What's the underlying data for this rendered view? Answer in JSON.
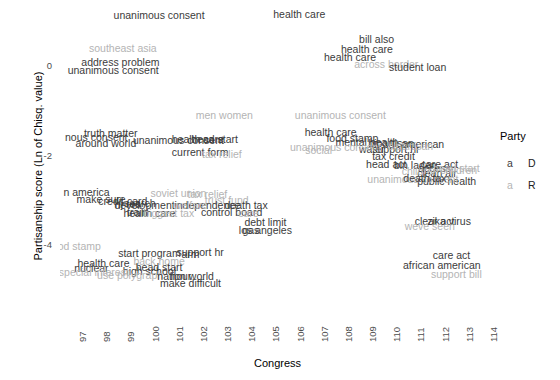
{
  "chart_data": {
    "type": "scatter",
    "title": "",
    "xlabel": "Congress",
    "ylabel": "Partisanship score (Ln of Chisq. value)",
    "xlim": [
      96.5,
      114.5
    ],
    "ylim": [
      -5.6,
      1.4
    ],
    "xticks": [
      97,
      98,
      99,
      100,
      101,
      102,
      103,
      104,
      105,
      106,
      107,
      108,
      109,
      110,
      111,
      112,
      113,
      114
    ],
    "yticks": [
      0,
      -2,
      -4
    ],
    "grid": false,
    "legend": {
      "title": "Party",
      "position": "right",
      "entries": [
        {
          "key": "a",
          "label": "D",
          "color": "#3b3b3b"
        },
        {
          "key": "a",
          "label": "R",
          "color": "#b4b4b4"
        }
      ]
    },
    "point_label_colors": {
      "D": "#3b3b3b",
      "R": "#b4b4b4"
    },
    "points": [
      {
        "text": "unanimous consent",
        "x": 100.6,
        "y": 1.15,
        "party": "D"
      },
      {
        "text": "health care",
        "x": 106.4,
        "y": 1.18,
        "party": "D"
      },
      {
        "text": "southeast asia",
        "x": 99.1,
        "y": 0.42,
        "party": "R"
      },
      {
        "text": "address problem",
        "x": 99.0,
        "y": 0.1,
        "party": "D"
      },
      {
        "text": "unanimous consent",
        "x": 98.7,
        "y": -0.08,
        "party": "D"
      },
      {
        "text": "bill also",
        "x": 109.6,
        "y": 0.62,
        "party": "D"
      },
      {
        "text": "health care",
        "x": 109.2,
        "y": 0.4,
        "party": "D"
      },
      {
        "text": "health care",
        "x": 108.5,
        "y": 0.22,
        "party": "D"
      },
      {
        "text": "across border",
        "x": 110.0,
        "y": 0.06,
        "party": "R"
      },
      {
        "text": "student loan",
        "x": 111.3,
        "y": -0.02,
        "party": "D"
      },
      {
        "text": "men women",
        "x": 103.3,
        "y": -1.1,
        "party": "R"
      },
      {
        "text": "unanimous consent",
        "x": 108.1,
        "y": -1.08,
        "party": "R"
      },
      {
        "text": "truth matter",
        "x": 98.6,
        "y": -1.5,
        "party": "D"
      },
      {
        "text": "nous consent",
        "x": 98.0,
        "y": -1.58,
        "party": "D"
      },
      {
        "text": "around world",
        "x": 98.4,
        "y": -1.72,
        "party": "D"
      },
      {
        "text": "unanimous consent",
        "x": 101.4,
        "y": -1.66,
        "party": "D"
      },
      {
        "text": "health care",
        "x": 102.2,
        "y": -1.64,
        "party": "D"
      },
      {
        "text": "head start",
        "x": 102.9,
        "y": -1.62,
        "party": "D"
      },
      {
        "text": "health care",
        "x": 107.7,
        "y": -1.48,
        "party": "D"
      },
      {
        "text": "food stamp",
        "x": 108.6,
        "y": -1.6,
        "party": "D"
      },
      {
        "text": "mental health",
        "x": 109.2,
        "y": -1.7,
        "party": "D"
      },
      {
        "text": "bipartisan",
        "x": 110.2,
        "y": -1.72,
        "party": "D"
      },
      {
        "text": "american",
        "x": 111.5,
        "y": -1.74,
        "party": "D"
      },
      {
        "text": "water",
        "x": 109.4,
        "y": -1.86,
        "party": "D"
      },
      {
        "text": "support hr",
        "x": 110.4,
        "y": -1.86,
        "party": "D"
      },
      {
        "text": "bipartisan",
        "x": 111.0,
        "y": -1.78,
        "party": "R"
      },
      {
        "text": "unanimous consent",
        "x": 107.9,
        "y": -1.8,
        "party": "R"
      },
      {
        "text": "social",
        "x": 107.2,
        "y": -1.88,
        "party": "R"
      },
      {
        "text": "current form",
        "x": 102.3,
        "y": -1.92,
        "party": "D"
      },
      {
        "text": "tax relief",
        "x": 103.2,
        "y": -1.96,
        "party": "R"
      },
      {
        "text": "tax credit",
        "x": 110.3,
        "y": -2.02,
        "party": "D"
      },
      {
        "text": "head act",
        "x": 110.0,
        "y": -2.18,
        "party": "D"
      },
      {
        "text": "bin laden",
        "x": 111.2,
        "y": -2.22,
        "party": "D"
      },
      {
        "text": "care act",
        "x": 112.2,
        "y": -2.18,
        "party": "D"
      },
      {
        "text": "access",
        "x": 112.0,
        "y": -2.28,
        "party": "D"
      },
      {
        "text": "clean air",
        "x": 112.1,
        "y": -2.4,
        "party": "D"
      },
      {
        "text": "children",
        "x": 111.4,
        "y": -2.34,
        "party": "R"
      },
      {
        "text": "head start",
        "x": 112.9,
        "y": -2.28,
        "party": "R"
      },
      {
        "text": "children",
        "x": 113.0,
        "y": -2.32,
        "party": "R"
      },
      {
        "text": "n america",
        "x": 97.6,
        "y": -2.82,
        "party": "D"
      },
      {
        "text": "make sure",
        "x": 98.2,
        "y": -2.98,
        "party": "D"
      },
      {
        "text": "credit card",
        "x": 99.1,
        "y": -3.02,
        "party": "D"
      },
      {
        "text": "soviet union",
        "x": 101.4,
        "y": -2.84,
        "party": "R"
      },
      {
        "text": "tax relief",
        "x": 102.6,
        "y": -2.86,
        "party": "R"
      },
      {
        "text": "trust fund",
        "x": 103.4,
        "y": -3.0,
        "party": "R"
      },
      {
        "text": "development",
        "x": 100.0,
        "y": -3.1,
        "party": "D"
      },
      {
        "text": "hj res",
        "x": 99.3,
        "y": -3.08,
        "party": "D"
      },
      {
        "text": "search",
        "x": 99.8,
        "y": -3.06,
        "party": "D"
      },
      {
        "text": "independence",
        "x": 102.6,
        "y": -3.12,
        "party": "D"
      },
      {
        "text": "welfare",
        "x": 101.9,
        "y": -3.1,
        "party": "R"
      },
      {
        "text": "death tax",
        "x": 104.2,
        "y": -3.1,
        "party": "D"
      },
      {
        "text": "control board",
        "x": 103.6,
        "y": -3.26,
        "party": "D"
      },
      {
        "text": "health care",
        "x": 100.2,
        "y": -3.28,
        "party": "D"
      },
      {
        "text": "train",
        "x": 99.7,
        "y": -3.26,
        "party": "D"
      },
      {
        "text": "biggest tax",
        "x": 101.0,
        "y": -3.3,
        "party": "R"
      },
      {
        "text": "care",
        "x": 104.3,
        "y": -3.28,
        "party": "R"
      },
      {
        "text": "debt limit",
        "x": 105.0,
        "y": -3.48,
        "party": "D"
      },
      {
        "text": "los angeles",
        "x": 105.0,
        "y": -3.66,
        "party": "D"
      },
      {
        "text": "gas",
        "x": 104.4,
        "y": -3.66,
        "party": "D"
      },
      {
        "text": "public health",
        "x": 112.5,
        "y": -2.58,
        "party": "D"
      },
      {
        "text": "unanimous consent",
        "x": 111.1,
        "y": -2.52,
        "party": "R"
      },
      {
        "text": "death tax",
        "x": 111.6,
        "y": -2.5,
        "party": "D"
      },
      {
        "text": "clear act",
        "x": 112.0,
        "y": -3.46,
        "party": "D"
      },
      {
        "text": "zika virus",
        "x": 112.6,
        "y": -3.46,
        "party": "D"
      },
      {
        "text": "weve seen",
        "x": 111.8,
        "y": -3.58,
        "party": "R"
      },
      {
        "text": "od stamp",
        "x": 97.3,
        "y": -4.02,
        "party": "R"
      },
      {
        "text": "start program",
        "x": 100.2,
        "y": -4.18,
        "party": "D"
      },
      {
        "text": "support hr",
        "x": 102.3,
        "y": -4.16,
        "party": "D"
      },
      {
        "text": "arm",
        "x": 101.9,
        "y": -4.2,
        "party": "D"
      },
      {
        "text": "back home",
        "x": 100.6,
        "y": -4.36,
        "party": "R"
      },
      {
        "text": "health care",
        "x": 98.3,
        "y": -4.42,
        "party": "D"
      },
      {
        "text": "head start",
        "x": 100.6,
        "y": -4.5,
        "party": "D"
      },
      {
        "text": "high school",
        "x": 100.2,
        "y": -4.58,
        "party": "D"
      },
      {
        "text": "nuclear",
        "x": 97.8,
        "y": -4.52,
        "party": "D"
      },
      {
        "text": "special interest",
        "x": 97.9,
        "y": -4.62,
        "party": "R"
      },
      {
        "text": "use polygraph",
        "x": 99.4,
        "y": -4.68,
        "party": "R"
      },
      {
        "text": "nation world",
        "x": 101.7,
        "y": -4.7,
        "party": "D"
      },
      {
        "text": "hour",
        "x": 101.5,
        "y": -4.7,
        "party": "D"
      },
      {
        "text": "make difficult",
        "x": 101.9,
        "y": -4.86,
        "party": "D"
      },
      {
        "text": "care act",
        "x": 112.7,
        "y": -4.24,
        "party": "D"
      },
      {
        "text": "african american",
        "x": 112.3,
        "y": -4.46,
        "party": "D"
      },
      {
        "text": "support bill",
        "x": 112.9,
        "y": -4.66,
        "party": "R"
      }
    ]
  }
}
